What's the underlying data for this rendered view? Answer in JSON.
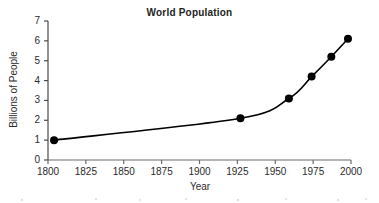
{
  "chart_data": {
    "type": "line",
    "title": "World Population",
    "xlabel": "Year",
    "ylabel": "Billions of People",
    "xlim": [
      1800,
      2000
    ],
    "ylim": [
      0,
      7
    ],
    "xticks": [
      "1800",
      "1825",
      "1850",
      "1875",
      "1900",
      "1925",
      "1950",
      "1975",
      "2000"
    ],
    "yticks": [
      "0",
      "1",
      "2",
      "3",
      "4",
      "5",
      "6",
      "7"
    ],
    "grid": false,
    "legend": "none",
    "marker": "filled-circle",
    "line_color": "#000000",
    "marker_color": "#000000",
    "x": [
      1804,
      1927,
      1959,
      1974,
      1987,
      1998
    ],
    "y": [
      1.0,
      2.1,
      3.1,
      4.2,
      5.2,
      6.1
    ],
    "points": [
      {
        "year": 1804,
        "population": 1.0
      },
      {
        "year": 1927,
        "population": 2.1
      },
      {
        "year": 1959,
        "population": 3.1
      },
      {
        "year": 1974,
        "population": 4.2
      },
      {
        "year": 1987,
        "population": 5.2
      },
      {
        "year": 1998,
        "population": 6.1
      }
    ]
  }
}
